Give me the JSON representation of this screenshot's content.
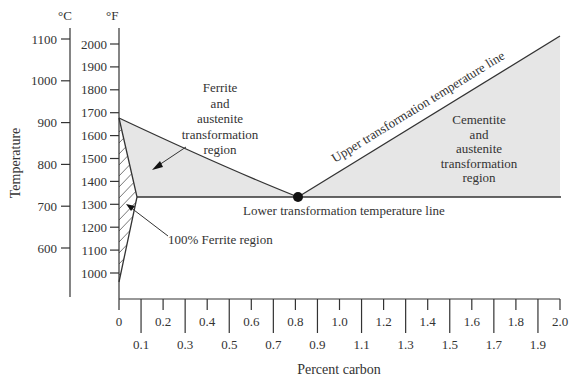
{
  "chart_data": {
    "type": "area",
    "title": "",
    "xlabel": "Percent carbon",
    "ylabel": "Temperature",
    "y_units": [
      "°C",
      "°F"
    ],
    "xlim": [
      0,
      2.0
    ],
    "ylim_F": [
      900,
      2100
    ],
    "x_ticks_upper": [
      "0",
      "0.2",
      "0.4",
      "0.6",
      "0.8",
      "1.0",
      "1.2",
      "1.4",
      "1.6",
      "1.8",
      "2.0"
    ],
    "x_ticks_lower": [
      "0.1",
      "0.3",
      "0.5",
      "0.7",
      "0.9",
      "1.1",
      "1.3",
      "1.5",
      "1.7",
      "1.9"
    ],
    "y_ticks_F": [
      "2000",
      "1900",
      "1800",
      "1700",
      "1600",
      "1500",
      "1400",
      "1300",
      "1200",
      "1100",
      "1000"
    ],
    "y_ticks_C": [
      "1100",
      "1000",
      "900",
      "800",
      "700",
      "600"
    ],
    "series": [
      {
        "name": "Upper transformation temperature line (hypoeutectoid)",
        "x": [
          0,
          0.2,
          0.4,
          0.6,
          0.8
        ],
        "y_F": [
          1670,
          1530,
          1440,
          1380,
          1333
        ]
      },
      {
        "name": "Upper transformation temperature line (hypereutectoid)",
        "x": [
          0.8,
          2.0
        ],
        "y_F": [
          1333,
          2030
        ]
      },
      {
        "name": "Lower transformation temperature line",
        "x": [
          0.08,
          2.0
        ],
        "y_F": [
          1333,
          1333
        ]
      },
      {
        "name": "Ferrite boundary",
        "x": [
          0,
          0.08,
          0
        ],
        "y_F": [
          1670,
          1333,
          960
        ]
      }
    ],
    "annotations": [
      {
        "text": "Ferrite and austenite transformation region"
      },
      {
        "text": "Cementite and austenite transformation region"
      },
      {
        "text": "Upper transformation temperature line"
      },
      {
        "text": "Lower transformation temperature line"
      },
      {
        "text": "100% Ferrite region"
      }
    ],
    "points": [
      {
        "name": "eutectoid",
        "x": 0.8,
        "y_F": 1333
      }
    ],
    "grid": false,
    "legend": "none"
  },
  "labels": {
    "celsius_unit": "°C",
    "fahrenheit_unit": "°F",
    "y_axis_title": "Temperature",
    "x_axis_title": "Percent carbon",
    "ferrite_region": [
      "Ferrite",
      "and",
      "austenite",
      "transformation",
      "region"
    ],
    "cementite_region": [
      "Cementite",
      "and",
      "austenite",
      "transformation",
      "region"
    ],
    "upper_line": "Upper transformation temperature line",
    "lower_line": "Lower transformation temperature line",
    "pure_ferrite": "100% Ferrite region"
  },
  "colors": {
    "fill": "#e6e6e6",
    "line": "#333333",
    "text": "#333333"
  }
}
